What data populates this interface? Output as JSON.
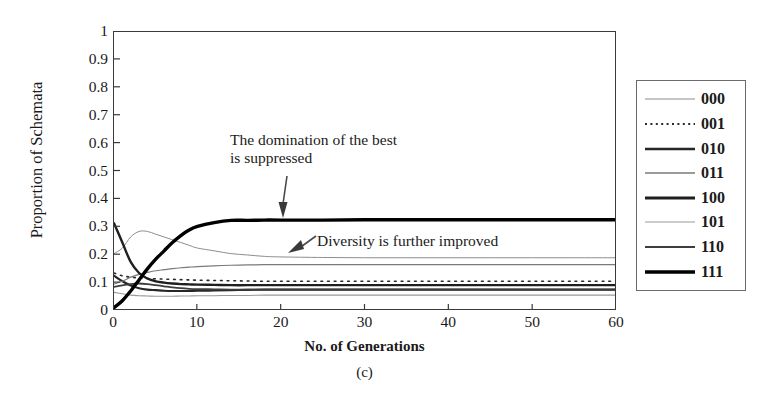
{
  "figure": {
    "caption": "(c)"
  },
  "chart_data": {
    "type": "line",
    "title": "",
    "xlabel": "No. of Generations",
    "ylabel": "Proportion of Schemata",
    "xlim": [
      0,
      60
    ],
    "ylim": [
      0,
      1
    ],
    "xticks": [
      0,
      10,
      20,
      30,
      40,
      50,
      60
    ],
    "yticks": [
      "0",
      "0.1",
      "0.2",
      "0.3",
      "0.4",
      "0.5",
      "0.6",
      "0.7",
      "0.8",
      "0.9",
      "1"
    ],
    "grid": false,
    "legend_position": "right-outside",
    "annotations": [
      {
        "name": "domination-note",
        "text": "The domination of the best\nis suppressed",
        "points_to_x": 20,
        "points_to_y": 0.32
      },
      {
        "name": "diversity-note",
        "text": "Diversity is further improved",
        "points_to_x": 13,
        "points_to_y": 0.19
      }
    ],
    "x": [
      0,
      1,
      2,
      3,
      4,
      5,
      6,
      7,
      8,
      9,
      10,
      12,
      14,
      16,
      18,
      20,
      25,
      30,
      35,
      40,
      45,
      50,
      55,
      60
    ],
    "series": [
      {
        "name": "000",
        "style": "solid",
        "width": 1.0,
        "color": "#8c8c8c",
        "values": [
          0.2,
          0.22,
          0.26,
          0.28,
          0.28,
          0.27,
          0.26,
          0.25,
          0.24,
          0.23,
          0.22,
          0.21,
          0.2,
          0.195,
          0.19,
          0.188,
          0.186,
          0.185,
          0.185,
          0.185,
          0.185,
          0.185,
          0.185,
          0.185
        ]
      },
      {
        "name": "001",
        "style": "dotted",
        "width": 1.6,
        "color": "#2a2a2a",
        "values": [
          0.13,
          0.12,
          0.115,
          0.112,
          0.11,
          0.109,
          0.108,
          0.107,
          0.106,
          0.105,
          0.104,
          0.103,
          0.102,
          0.101,
          0.1,
          0.1,
          0.1,
          0.1,
          0.1,
          0.1,
          0.1,
          0.1,
          0.1,
          0.1
        ]
      },
      {
        "name": "010",
        "style": "solid",
        "width": 2.2,
        "color": "#262626",
        "values": [
          0.12,
          0.1,
          0.085,
          0.075,
          0.07,
          0.068,
          0.066,
          0.065,
          0.065,
          0.065,
          0.066,
          0.067,
          0.068,
          0.069,
          0.07,
          0.07,
          0.07,
          0.07,
          0.07,
          0.07,
          0.07,
          0.07,
          0.07,
          0.07
        ]
      },
      {
        "name": "011",
        "style": "solid",
        "width": 1.2,
        "color": "#7a7a7a",
        "values": [
          0.09,
          0.1,
          0.115,
          0.125,
          0.132,
          0.138,
          0.142,
          0.146,
          0.149,
          0.151,
          0.153,
          0.156,
          0.158,
          0.159,
          0.16,
          0.16,
          0.16,
          0.16,
          0.16,
          0.16,
          0.16,
          0.16,
          0.16,
          0.16
        ]
      },
      {
        "name": "100",
        "style": "solid",
        "width": 2.4,
        "color": "#1f1f1f",
        "values": [
          0.31,
          0.24,
          0.17,
          0.13,
          0.11,
          0.1,
          0.095,
          0.092,
          0.09,
          0.089,
          0.088,
          0.087,
          0.086,
          0.086,
          0.086,
          0.086,
          0.086,
          0.086,
          0.086,
          0.086,
          0.086,
          0.086,
          0.086,
          0.086
        ]
      },
      {
        "name": "101",
        "style": "solid",
        "width": 1.1,
        "color": "#9a9a9a",
        "values": [
          0.06,
          0.055,
          0.05,
          0.048,
          0.047,
          0.046,
          0.046,
          0.046,
          0.047,
          0.047,
          0.048,
          0.048,
          0.049,
          0.049,
          0.05,
          0.05,
          0.05,
          0.05,
          0.05,
          0.05,
          0.05,
          0.05,
          0.05,
          0.05
        ]
      },
      {
        "name": "110",
        "style": "solid",
        "width": 1.8,
        "color": "#3d3d3d",
        "values": [
          0.08,
          0.085,
          0.09,
          0.092,
          0.09,
          0.086,
          0.082,
          0.078,
          0.075,
          0.073,
          0.072,
          0.071,
          0.07,
          0.07,
          0.07,
          0.07,
          0.07,
          0.07,
          0.07,
          0.07,
          0.07,
          0.07,
          0.07,
          0.07
        ]
      },
      {
        "name": "111",
        "style": "solid",
        "width": 3.4,
        "color": "#000000",
        "values": [
          0.005,
          0.03,
          0.065,
          0.105,
          0.145,
          0.18,
          0.21,
          0.24,
          0.265,
          0.285,
          0.298,
          0.312,
          0.32,
          0.32,
          0.321,
          0.321,
          0.321,
          0.322,
          0.322,
          0.322,
          0.322,
          0.322,
          0.322,
          0.322
        ]
      }
    ]
  },
  "legend": {
    "entries": [
      {
        "label": "000",
        "style": "solid",
        "width": 1.0,
        "color": "#8c8c8c"
      },
      {
        "label": "001",
        "style": "dotted",
        "width": 1.8,
        "color": "#2a2a2a"
      },
      {
        "label": "010",
        "style": "solid",
        "width": 2.4,
        "color": "#262626"
      },
      {
        "label": "011",
        "style": "solid",
        "width": 1.4,
        "color": "#7a7a7a"
      },
      {
        "label": "100",
        "style": "solid",
        "width": 2.8,
        "color": "#1f1f1f"
      },
      {
        "label": "101",
        "style": "solid",
        "width": 1.2,
        "color": "#9a9a9a"
      },
      {
        "label": "110",
        "style": "solid",
        "width": 2.0,
        "color": "#3d3d3d"
      },
      {
        "label": "111",
        "style": "solid",
        "width": 3.6,
        "color": "#000000"
      }
    ]
  }
}
